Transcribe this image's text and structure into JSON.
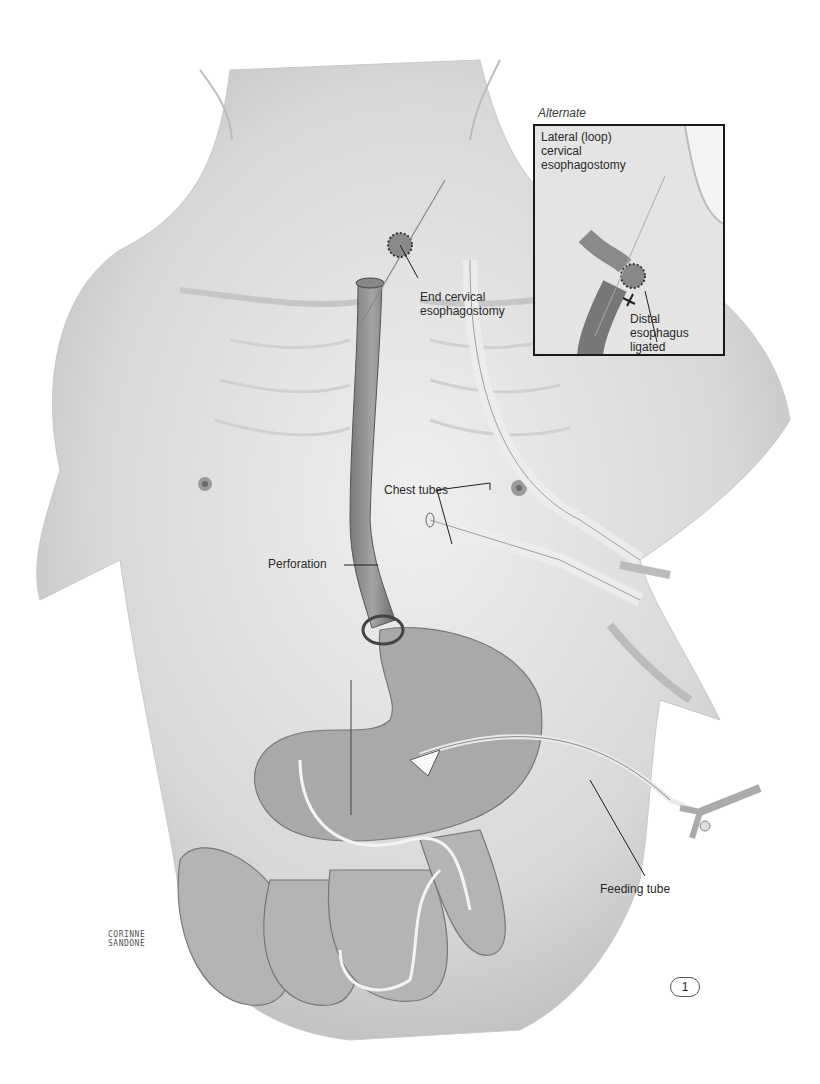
{
  "figure": {
    "number": "1",
    "signature": "CORINNE\nSANDONE",
    "colors": {
      "skin": "#e6e6e6",
      "skin_shadow": "#bdbdbd",
      "organ": "#9a9a9a",
      "organ_dark": "#6e6e6e",
      "line": "#1e1e1e",
      "background": "#ffffff"
    }
  },
  "labels": {
    "end_cervical": "End cervical\nesophagostomy",
    "chest_tubes": "Chest tubes",
    "perforation": "Perforation",
    "feeding_tube": "Feeding tube"
  },
  "inset": {
    "heading": "Alternate",
    "title": "Lateral (loop)\ncervical\nesophagostomy",
    "distal": "Distal\nesophagus\nligated"
  }
}
